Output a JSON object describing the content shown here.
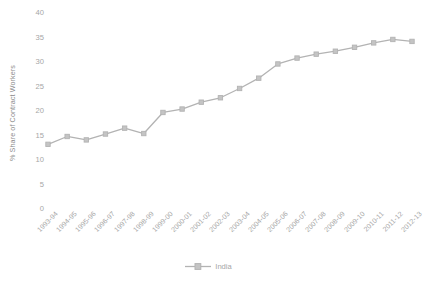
{
  "chart_data": {
    "type": "line",
    "title": "",
    "xlabel": "",
    "ylabel": "% Share of Contract Workers",
    "ylim": [
      0,
      40
    ],
    "yticks": [
      0,
      5,
      10,
      15,
      20,
      25,
      30,
      35,
      40
    ],
    "grid": false,
    "legend_position": "bottom",
    "categories": [
      "1993-94",
      "1994-95",
      "1995-96",
      "1996-97",
      "1997-98",
      "1998-99",
      "1999-00",
      "2000-01",
      "2001-02",
      "2002-03",
      "2003-04",
      "2004-05",
      "2005-06",
      "2006-07",
      "2007-08",
      "2008-09",
      "2009-10",
      "2010-11",
      "2011-12",
      "2012-13"
    ],
    "series": [
      {
        "name": "India",
        "color": "#b3b3b3",
        "marker": "square",
        "values": [
          13.2,
          14.8,
          14.1,
          15.3,
          16.5,
          15.4,
          19.7,
          20.4,
          21.8,
          22.7,
          24.6,
          26.7,
          29.6,
          30.8,
          31.6,
          32.2,
          33.0,
          33.9,
          34.6,
          34.2
        ]
      }
    ]
  },
  "legend": {
    "entries": [
      {
        "label": "India",
        "marker_icon": "line-square-marker-icon"
      }
    ]
  },
  "colors": {
    "series_line": "#b3b3b3",
    "tick_text": "#a6a6a6",
    "axis_title": "#8c8c8c",
    "background": "#ffffff"
  }
}
